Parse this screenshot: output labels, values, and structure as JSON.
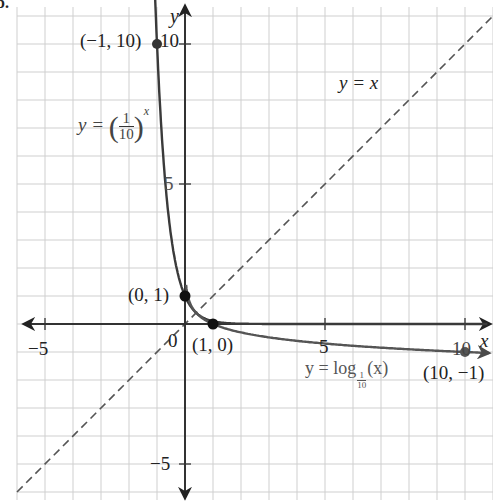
{
  "figure_marker": "b.",
  "chart_data": {
    "type": "line",
    "title": "",
    "xlabel": "x",
    "ylabel": "y",
    "xlim": [
      -6,
      11
    ],
    "ylim": [
      -6.2,
      11.3
    ],
    "grid": true,
    "x_ticks": [
      -5,
      0,
      5,
      10
    ],
    "y_ticks": [
      -5,
      5,
      10
    ],
    "tick_labels": {
      "x_neg5": "−5",
      "origin": "0",
      "x5": "5",
      "x10": "10",
      "y5": "5",
      "y10": "10",
      "y_neg5": "−5"
    },
    "series": [
      {
        "name": "y = (1/10)^x",
        "style": "solid",
        "color": "#3a3a3a",
        "function": "exponential base 1/10",
        "x": [
          -1.1,
          -1,
          -0.5,
          0,
          0.5,
          1,
          2,
          5,
          11
        ],
        "y": [
          12.6,
          10,
          3.16,
          1,
          0.316,
          0.1,
          0.01,
          1e-05,
          0
        ]
      },
      {
        "name": "y = log_{1/10}(x)",
        "style": "solid",
        "color": "#555555",
        "function": "logarithm base 1/10",
        "x": [
          0.05,
          0.1,
          0.316,
          1,
          2,
          5,
          10,
          11
        ],
        "y": [
          1.3,
          1,
          0.5,
          0,
          -0.301,
          -0.699,
          -1,
          -1.04
        ]
      },
      {
        "name": "y = x",
        "style": "dashed",
        "color": "#555555",
        "x": [
          -6,
          11
        ],
        "y": [
          -6,
          11
        ]
      }
    ],
    "points": [
      {
        "label": "(−1, 10)",
        "x": -1,
        "y": 10
      },
      {
        "label": "(0, 1)",
        "x": 0,
        "y": 1
      },
      {
        "label": "(1, 0)",
        "x": 1,
        "y": 0
      },
      {
        "label": "(10, −1)",
        "x": 10,
        "y": -1
      }
    ],
    "annotations": [
      {
        "text": "y = x",
        "x": 5.6,
        "y": 8.5
      },
      {
        "text": "y = (1/10)^x",
        "x": -3.8,
        "y": 7
      },
      {
        "text": "y = log_{1/10}(x)",
        "x": 4.5,
        "y": -1.6
      }
    ]
  },
  "labels": {
    "axis_x": "x",
    "axis_y": "y",
    "pt_neg1_10": "(−1, 10)",
    "pt_0_1": "(0, 1)",
    "pt_1_0": "(1, 0)",
    "pt_10_neg1": "(10, −1)",
    "tick_x_neg5": "−5",
    "tick_origin": "0",
    "tick_x5": "5",
    "tick_x10": "10",
    "tick_y5": "5",
    "tick_y10": "10",
    "tick_y_neg5": "−5",
    "eq_identity": "y = x",
    "eq_exp_prefix": "y = ",
    "eq_exp_num": "1",
    "eq_exp_den": "10",
    "eq_exp_power": "x",
    "eq_log_prefix": "y = log",
    "eq_log_num": "1",
    "eq_log_den": "10",
    "eq_log_arg": "(x)"
  }
}
